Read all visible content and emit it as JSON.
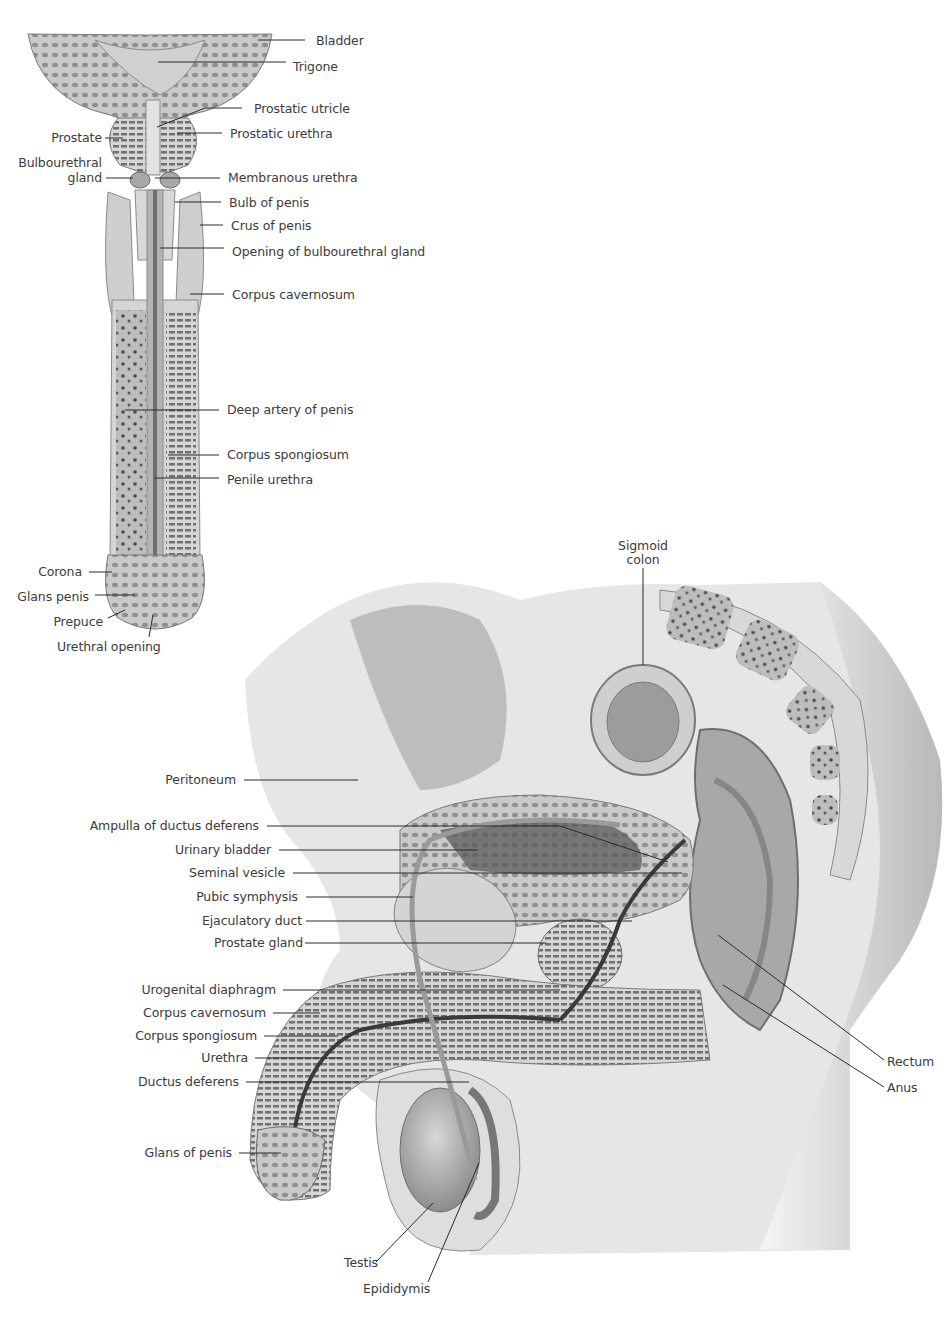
{
  "figure": {
    "coronal_view": {
      "labels": {
        "bladder": "Bladder",
        "trigone": "Trigone",
        "prostatic_utricle": "Prostatic utricle",
        "prostatic_urethra": "Prostatic urethra",
        "prostate": "Prostate",
        "bulbourethral_gland_line1": "Bulbourethral",
        "bulbourethral_gland_line2": "gland",
        "membranous_urethra": "Membranous urethra",
        "bulb_of_penis": "Bulb of penis",
        "crus_of_penis": "Crus of penis",
        "opening_of_bulbourethral_gland": "Opening of bulbourethral gland",
        "corpus_cavernosum": "Corpus cavernosum",
        "deep_artery_of_penis": "Deep artery of penis",
        "corpus_spongiosum": "Corpus spongiosum",
        "penile_urethra": "Penile urethra",
        "corona": "Corona",
        "glans_penis": "Glans penis",
        "prepuce": "Prepuce",
        "urethral_opening": "Urethral opening"
      }
    },
    "sagittal_view": {
      "labels": {
        "sigmoid_colon_line1": "Sigmoid",
        "sigmoid_colon_line2": "colon",
        "peritoneum": "Peritoneum",
        "ampulla_of_ductus_deferens": "Ampulla of ductus deferens",
        "urinary_bladder": "Urinary bladder",
        "seminal_vesicle": "Seminal vesicle",
        "pubic_symphysis": "Pubic symphysis",
        "ejaculatory_duct": "Ejaculatory duct",
        "prostate_gland": "Prostate gland",
        "urogenital_diaphragm": "Urogenital diaphragm",
        "corpus_cavernosum": "Corpus cavernosum",
        "corpus_spongiosum": "Corpus spongiosum",
        "urethra": "Urethra",
        "ductus_deferens": "Ductus deferens",
        "glans_of_penis": "Glans of penis",
        "testis": "Testis",
        "epididymis": "Epididymis",
        "rectum": "Rectum",
        "anus": "Anus"
      }
    }
  }
}
